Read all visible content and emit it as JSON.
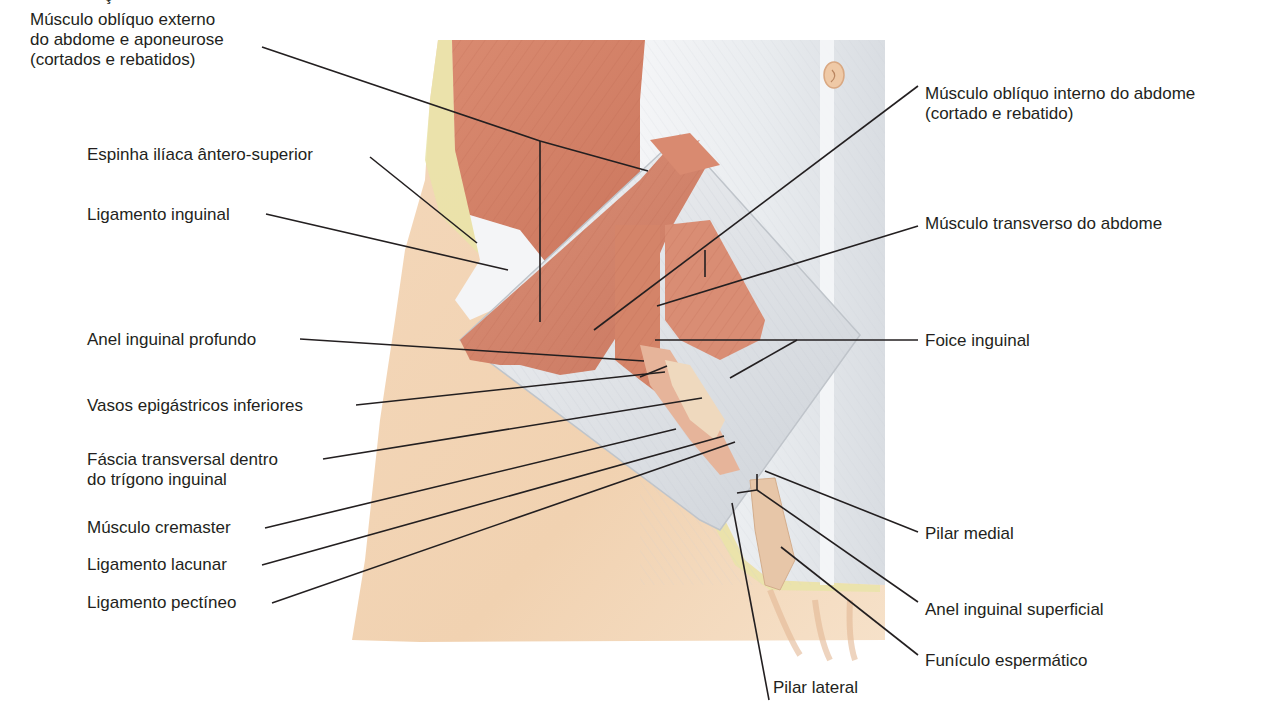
{
  "figure": {
    "top_fragment": "ç",
    "colors": {
      "skin": "#f2d3b3",
      "skin_shadow": "#e8bf98",
      "muscle": "#d9876c",
      "muscle_dark": "#c66f55",
      "aponeurosis": "#eef0f2",
      "aponeurosis_shadow": "#cfd3d8",
      "fat": "#e9e4a8",
      "leader_line": "#231f20",
      "text": "#231f20",
      "background": "#ffffff"
    }
  },
  "labels": {
    "left": [
      {
        "id": "obliquo-externo",
        "lines": [
          "Músculo oblíquo externo",
          "do abdome e aponeurose",
          "(cortados e rebatidos)"
        ]
      },
      {
        "id": "espinha-iliaca",
        "lines": [
          "Espinha ilíaca ântero-superior"
        ]
      },
      {
        "id": "ligamento-inguinal",
        "lines": [
          "Ligamento inguinal"
        ]
      },
      {
        "id": "anel-inguinal-profundo",
        "lines": [
          "Anel inguinal profundo"
        ]
      },
      {
        "id": "vasos-epigastricos",
        "lines": [
          "Vasos epigástricos inferiores"
        ]
      },
      {
        "id": "fascia-transversal",
        "lines": [
          "Fáscia transversal dentro",
          "do trígono inguinal"
        ]
      },
      {
        "id": "musculo-cremaster",
        "lines": [
          "Músculo cremaster"
        ]
      },
      {
        "id": "ligamento-lacunar",
        "lines": [
          "Ligamento lacunar"
        ]
      },
      {
        "id": "ligamento-pectineo",
        "lines": [
          "Ligamento pectíneo"
        ]
      }
    ],
    "right": [
      {
        "id": "obliquo-interno",
        "lines": [
          "Músculo oblíquo interno do abdome",
          "(cortado e rebatido)"
        ]
      },
      {
        "id": "transverso-abdome",
        "lines": [
          "Músculo transverso do abdome"
        ]
      },
      {
        "id": "foice-inguinal",
        "lines": [
          "Foice inguinal"
        ]
      },
      {
        "id": "pilar-medial",
        "lines": [
          "Pilar medial"
        ]
      },
      {
        "id": "anel-inguinal-superficial",
        "lines": [
          "Anel inguinal superficial"
        ]
      },
      {
        "id": "funiculo-espermatico",
        "lines": [
          "Funículo espermático"
        ]
      }
    ],
    "bottom": [
      {
        "id": "pilar-lateral",
        "lines": [
          "Pilar lateral"
        ]
      }
    ]
  }
}
